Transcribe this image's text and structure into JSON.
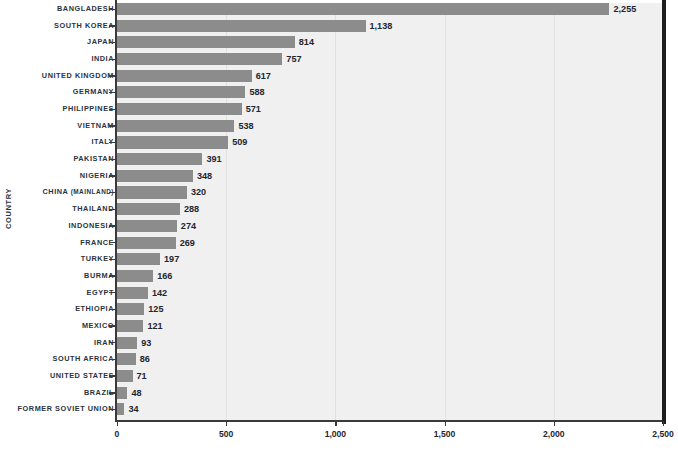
{
  "chart_data": {
    "type": "bar",
    "orientation": "horizontal",
    "title": "",
    "xlabel": "",
    "ylabel": "COUNTRY",
    "xlim": [
      0,
      2500
    ],
    "xticks": [
      0,
      500,
      1000,
      1500,
      2000,
      2500
    ],
    "xtick_labels": [
      "0",
      "500",
      "1,000",
      "1,500",
      "2,000",
      "2,500"
    ],
    "grid": "vertical",
    "legend": "none",
    "bar_color": "#8c8c8c",
    "plot_background": "#f0f0f0",
    "label_color": "#2b3340",
    "categories": [
      "Bangladesh",
      "South Korea",
      "Japan",
      "India",
      "United Kingdom",
      "Germany",
      "Philippines",
      "Vietnam",
      "Italy",
      "Pakistan",
      "Nigeria",
      "China (mainland)",
      "Thailand",
      "Indonesia",
      "France",
      "Turkey",
      "Burma",
      "Egypt",
      "Ethiopia",
      "Mexico",
      "Iran",
      "South Africa",
      "United States",
      "Brazil",
      "Former Soviet Union"
    ],
    "values": [
      2255,
      1138,
      814,
      757,
      617,
      588,
      571,
      538,
      509,
      391,
      348,
      320,
      288,
      274,
      269,
      197,
      166,
      142,
      125,
      121,
      93,
      86,
      71,
      48,
      34
    ],
    "value_labels": [
      "2,255",
      "1,138",
      "814",
      "757",
      "617",
      "588",
      "571",
      "538",
      "509",
      "391",
      "348",
      "320",
      "288",
      "274",
      "269",
      "197",
      "166",
      "142",
      "125",
      "121",
      "93",
      "86",
      "71",
      "48",
      "34"
    ]
  }
}
